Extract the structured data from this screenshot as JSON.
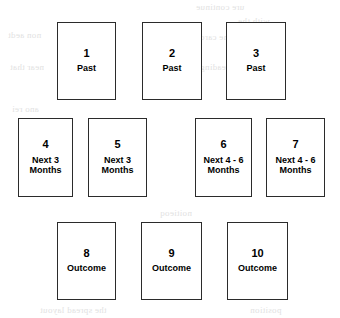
{
  "diagram": {
    "type": "card-spread-layout",
    "canvas": {
      "width": 340,
      "height": 318,
      "background": "#ffffff"
    },
    "card_style": {
      "border_color": "#2b2b2b",
      "fill_color": "#ffffff",
      "text_color": "#000000",
      "width": 59,
      "height": 78
    },
    "rows": [
      {
        "name": "past-row",
        "label": "Past",
        "top": 22
      },
      {
        "name": "near-future-row",
        "label": "Next 3 / Next 4 - 6 Months",
        "top": 118
      },
      {
        "name": "outcome-row",
        "label": "Outcome",
        "top": 222
      }
    ],
    "cards": [
      {
        "number": "1",
        "label": "Past",
        "x": 57,
        "y": 22,
        "row": "past-row"
      },
      {
        "number": "2",
        "label": "Past",
        "x": 142,
        "y": 22,
        "row": "past-row"
      },
      {
        "number": "3",
        "label": "Past",
        "x": 226,
        "y": 22,
        "row": "past-row"
      },
      {
        "number": "4",
        "label": "Next 3\nMonths",
        "x": 18,
        "y": 118,
        "row": "near-future-row"
      },
      {
        "number": "5",
        "label": "Next 3\nMonths",
        "x": 88,
        "y": 118,
        "row": "near-future-row"
      },
      {
        "number": "6",
        "label": "Next 4 - 6\nMonths",
        "x": 195,
        "y": 118,
        "row": "near-future-row"
      },
      {
        "number": "7",
        "label": "Next 4 - 6\nMonths",
        "x": 266,
        "y": 118,
        "row": "near-future-row"
      },
      {
        "number": "8",
        "label": "Outcome",
        "x": 57,
        "y": 222,
        "row": "outcome-row"
      },
      {
        "number": "9",
        "label": "Outcome",
        "x": 141,
        "y": 222,
        "row": "outcome-row"
      },
      {
        "number": "10",
        "label": "Outcome",
        "x": 227,
        "y": 222,
        "row": "outcome-row"
      }
    ]
  }
}
